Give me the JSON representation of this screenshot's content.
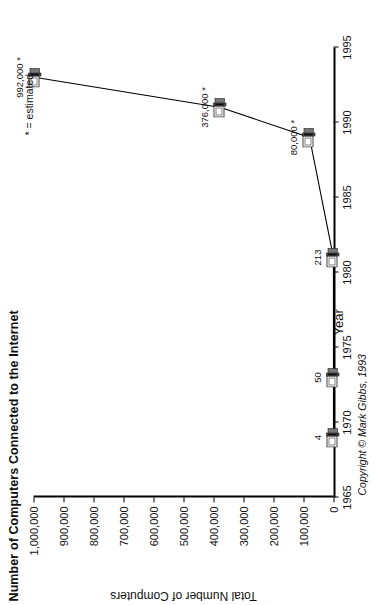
{
  "chart_data": {
    "type": "line",
    "title": "Number of Computers Connected to the Internet",
    "xlabel": "Year",
    "ylabel": "Total Number of Computers",
    "xlim": [
      1965,
      1995
    ],
    "ylim": [
      0,
      1000000
    ],
    "grid": false,
    "legend": "none",
    "orientation": "rotated-90-ccw",
    "xticks": [
      "1965",
      "1970",
      "1975",
      "1980",
      "1985",
      "1990",
      "1995"
    ],
    "xtick_values": [
      1965,
      1970,
      1975,
      1980,
      1985,
      1990,
      1995
    ],
    "yticks": [
      "0",
      "100,000",
      "200,000",
      "300,000",
      "400,000",
      "500,000",
      "600,000",
      "700,000",
      "800,000",
      "900,000",
      "1,000,000"
    ],
    "ytick_values": [
      0,
      100000,
      200000,
      300000,
      400000,
      500000,
      600000,
      700000,
      800000,
      900000,
      1000000
    ],
    "x": [
      1969,
      1973,
      1981,
      1989,
      1991,
      1993
    ],
    "values": [
      4,
      50,
      213,
      80000,
      376000,
      992000
    ],
    "point_labels": [
      "4",
      "50",
      "213",
      "80,000 *",
      "376,000 *",
      "992,000 *"
    ],
    "marker": "computer-icon",
    "annotations": [
      "* = estimated",
      "Copyright © Mark Gibbs, 1993"
    ],
    "color_line": "#000000",
    "color_text": "#111111"
  },
  "notes": {
    "estimated": "* = estimated",
    "copyright": "Copyright © Mark Gibbs, 1993"
  }
}
